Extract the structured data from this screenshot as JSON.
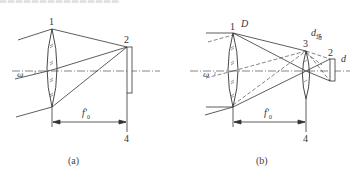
{
  "figure": {
    "top_cut_text": "",
    "panels": [
      {
        "id": "a",
        "caption": "(a)",
        "labels": {
          "objective": "1",
          "reticle": "2",
          "focal_plane": "4",
          "focal_length": "f′",
          "focal_length_sub": "0",
          "field_angle": "ω"
        }
      },
      {
        "id": "b",
        "caption": "(b)",
        "labels": {
          "objective": "1",
          "aperture": "D",
          "field_lens": "3",
          "field_lens_diameter": "d",
          "field_lens_diameter_sub": "场",
          "detector": "2",
          "detector_diameter": "d",
          "focal_plane": "4",
          "focal_length": "f′",
          "focal_length_sub": "0",
          "field_angle": "ω"
        }
      }
    ]
  }
}
